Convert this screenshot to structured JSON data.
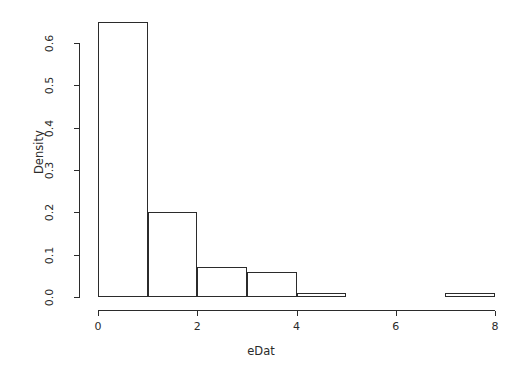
{
  "chart_data": {
    "type": "bar",
    "title": "",
    "subtitle": "",
    "xlabel": "eDat",
    "ylabel": "Density",
    "xlim": [
      0,
      8
    ],
    "ylim": [
      0.0,
      0.6
    ],
    "grid": false,
    "legend": null,
    "bin_width": 1,
    "bin_edges": [
      0,
      1,
      2,
      3,
      4,
      5,
      6,
      7,
      8
    ],
    "categories": [
      "0-1",
      "1-2",
      "2-3",
      "3-4",
      "4-5",
      "5-6",
      "6-7",
      "7-8"
    ],
    "values": [
      0.65,
      0.2,
      0.07,
      0.06,
      0.01,
      0.0,
      0.0,
      0.01
    ],
    "x_ticks": [
      {
        "value": 0,
        "label": "0"
      },
      {
        "value": 2,
        "label": "2"
      },
      {
        "value": 4,
        "label": "4"
      },
      {
        "value": 6,
        "label": "6"
      },
      {
        "value": 8,
        "label": "8"
      }
    ],
    "y_ticks": [
      {
        "value": 0.0,
        "label": "0.0"
      },
      {
        "value": 0.1,
        "label": "0.1"
      },
      {
        "value": 0.2,
        "label": "0.2"
      },
      {
        "value": 0.3,
        "label": "0.3"
      },
      {
        "value": 0.4,
        "label": "0.4"
      },
      {
        "value": 0.5,
        "label": "0.5"
      },
      {
        "value": 0.6,
        "label": "0.6"
      }
    ],
    "colors": {
      "line": "#2b2b2b",
      "fill": "#ffffff",
      "background": "#ffffff",
      "text": "#2b2b2b"
    }
  }
}
